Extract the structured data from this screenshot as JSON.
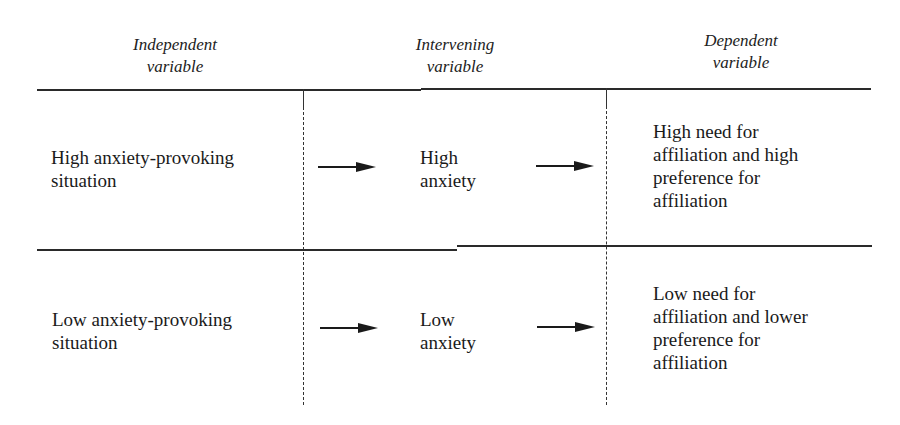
{
  "headers": {
    "independent": {
      "line1": "Independent",
      "line2": "variable"
    },
    "intervening": {
      "line1": "Intervening",
      "line2": "variable"
    },
    "dependent": {
      "line1": "Dependent",
      "line2": "variable"
    }
  },
  "rows": [
    {
      "independent": [
        "High anxiety-provoking",
        "situation"
      ],
      "intervening": [
        "High",
        "anxiety"
      ],
      "dependent": [
        "High need for",
        "affiliation and high",
        "preference for",
        "affiliation"
      ]
    },
    {
      "independent": [
        "Low anxiety-provoking",
        "situation"
      ],
      "intervening": [
        "Low",
        "anxiety"
      ],
      "dependent": [
        "Low need for",
        "affiliation and lower",
        "preference for",
        "affiliation"
      ]
    }
  ],
  "icons": {
    "arrow": "right-arrow-icon"
  }
}
